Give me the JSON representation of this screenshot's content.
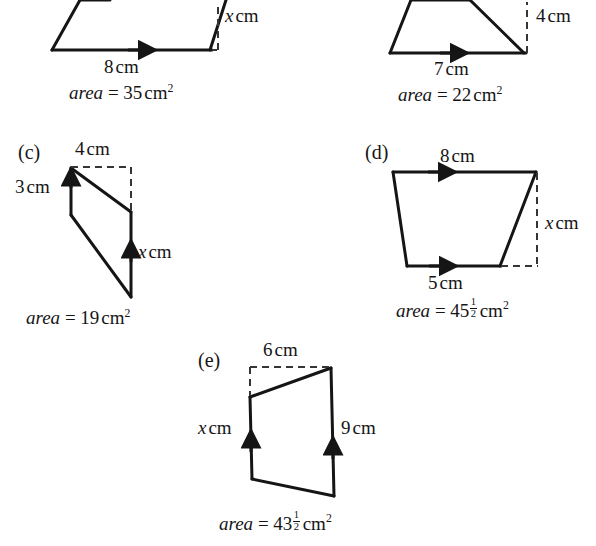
{
  "exercise": {
    "description": "Five diagrams of parallelograms and trapezia with given side lengths, heights and areas; x is the unknown dimension.",
    "parts": [
      {
        "id": "a",
        "label": "",
        "shape": "parallelogram",
        "labels": [
          {
            "name": "height-label",
            "text": "x cm",
            "var": "x",
            "unit": "cm"
          },
          {
            "name": "base-label",
            "text": "8 cm",
            "value": 8,
            "unit": "cm"
          }
        ],
        "area_prefix": "area",
        "area_equals": "=",
        "area_value": "35",
        "area_fraction": null,
        "area_unit": "cm",
        "area_superscript": "2",
        "area_text": "area = 35 cm2"
      },
      {
        "id": "b",
        "label": "",
        "shape": "trapezium",
        "labels": [
          {
            "name": "height-label",
            "text": "4 cm",
            "value": 4,
            "unit": "cm"
          },
          {
            "name": "base-label",
            "text": "7 cm",
            "value": 7,
            "unit": "cm"
          }
        ],
        "area_prefix": "area",
        "area_equals": "=",
        "area_value": "22",
        "area_fraction": null,
        "area_unit": "cm",
        "area_superscript": "2",
        "area_text": "area = 22 cm2"
      },
      {
        "id": "c",
        "label": "(c)",
        "shape": "trapezium",
        "labels": [
          {
            "name": "top-label",
            "text": "4 cm",
            "value": 4,
            "unit": "cm"
          },
          {
            "name": "left-side-label",
            "text": "3 cm",
            "value": 3,
            "unit": "cm"
          },
          {
            "name": "right-side-label",
            "text": "x cm",
            "var": "x",
            "unit": "cm"
          }
        ],
        "area_prefix": "area",
        "area_equals": "=",
        "area_value": "19",
        "area_fraction": null,
        "area_unit": "cm",
        "area_superscript": "2",
        "area_text": "area = 19 cm2"
      },
      {
        "id": "d",
        "label": "(d)",
        "shape": "trapezium",
        "labels": [
          {
            "name": "top-label",
            "text": "8 cm",
            "value": 8,
            "unit": "cm"
          },
          {
            "name": "height-label",
            "text": "x cm",
            "var": "x",
            "unit": "cm"
          },
          {
            "name": "bottom-label",
            "text": "5 cm",
            "value": 5,
            "unit": "cm"
          }
        ],
        "area_prefix": "area",
        "area_equals": "=",
        "area_value": "45",
        "area_fraction": {
          "numerator": "1",
          "denominator": "2"
        },
        "area_unit": "cm",
        "area_superscript": "2",
        "area_text": "area = 45 1/2 cm2"
      },
      {
        "id": "e",
        "label": "(e)",
        "shape": "trapezium",
        "labels": [
          {
            "name": "top-label",
            "text": "6 cm",
            "value": 6,
            "unit": "cm"
          },
          {
            "name": "left-side-label",
            "text": "x cm",
            "var": "x",
            "unit": "cm"
          },
          {
            "name": "right-side-label",
            "text": "9 cm",
            "value": 9,
            "unit": "cm"
          }
        ],
        "area_prefix": "area",
        "area_equals": "=",
        "area_value": "43",
        "area_fraction": {
          "numerator": "1",
          "denominator": "2"
        },
        "area_unit": "cm",
        "area_superscript": "2",
        "area_text": "area = 43 1/2 cm2"
      }
    ]
  },
  "text": {
    "part_c_label": "(c)",
    "part_d_label": "(d)",
    "part_e_label": "(e)",
    "a_x_cm": "x",
    "a_unit": "cm",
    "a_base": "8",
    "a_base_unit": "cm",
    "a_area_word": "area",
    "a_eq": "=",
    "a_area_num": "35",
    "a_area_unit": "cm",
    "b_height": "4",
    "b_height_unit": "cm",
    "b_base": "7",
    "b_base_unit": "cm",
    "b_area_word": "area",
    "b_eq": "=",
    "b_area_num": "22",
    "b_area_unit": "cm",
    "c_top": "4",
    "c_top_unit": "cm",
    "c_left": "3",
    "c_left_unit": "cm",
    "c_x": "x",
    "c_x_unit": "cm",
    "c_area_word": "area",
    "c_eq": "=",
    "c_area_num": "19",
    "c_area_unit": "cm",
    "d_top": "8",
    "d_top_unit": "cm",
    "d_x": "x",
    "d_x_unit": "cm",
    "d_bottom": "5",
    "d_bottom_unit": "cm",
    "d_area_word": "area",
    "d_eq": "=",
    "d_area_num": "45",
    "d_area_frac_num": "1",
    "d_area_frac_den": "2",
    "d_area_unit": "cm",
    "e_top": "6",
    "e_top_unit": "cm",
    "e_x": "x",
    "e_x_unit": "cm",
    "e_right": "9",
    "e_right_unit": "cm",
    "e_area_word": "area",
    "e_eq": "=",
    "e_area_num": "43",
    "e_area_frac_num": "1",
    "e_area_frac_den": "2",
    "e_area_unit": "cm",
    "superscript_two": "2"
  },
  "colors": {
    "ink": "#151515",
    "paper": "#ffffff",
    "dash": "#4a4a4a"
  }
}
